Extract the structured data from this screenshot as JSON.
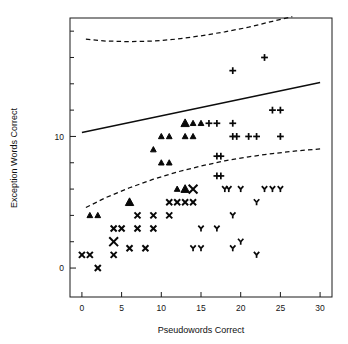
{
  "chart_data": {
    "type": "scatter",
    "title": "",
    "xlabel": "Pseudowords Correct",
    "ylabel": "Exception Words Correct",
    "xlim": [
      -1.5,
      31.5
    ],
    "ylim": [
      -2.2,
      19.0
    ],
    "xticks": [
      0,
      5,
      10,
      15,
      20,
      25,
      30
    ],
    "xtick_labels": [
      "0",
      "5",
      "10",
      "15",
      "20",
      "25",
      "30"
    ],
    "yticks": [
      0,
      2,
      4,
      6,
      8,
      10,
      12,
      14,
      16,
      18
    ],
    "ytick_labels": [
      "0",
      "",
      "",
      "",
      "",
      "10",
      "",
      "",
      "",
      ""
    ],
    "ytick_labeled": [
      0,
      10
    ],
    "grid": false,
    "legend": "none",
    "frame": "box",
    "series": [
      {
        "name": "group-triangle",
        "marker": "triangle-up",
        "points": [
          {
            "x": 1,
            "y": 4,
            "size": "small"
          },
          {
            "x": 2,
            "y": 4,
            "size": "small"
          },
          {
            "x": 6,
            "y": 5,
            "size": "large"
          },
          {
            "x": 9,
            "y": 9,
            "size": "small"
          },
          {
            "x": 10,
            "y": 8,
            "size": "small"
          },
          {
            "x": 10,
            "y": 10,
            "size": "small"
          },
          {
            "x": 11,
            "y": 8,
            "size": "small"
          },
          {
            "x": 11,
            "y": 10,
            "size": "small"
          },
          {
            "x": 12,
            "y": 6,
            "size": "small"
          },
          {
            "x": 13,
            "y": 6,
            "size": "large"
          },
          {
            "x": 13,
            "y": 10,
            "size": "small"
          },
          {
            "x": 13,
            "y": 11,
            "size": "large"
          },
          {
            "x": 14,
            "y": 10,
            "size": "small"
          },
          {
            "x": 14,
            "y": 11,
            "size": "small"
          },
          {
            "x": 15,
            "y": 11,
            "size": "small"
          }
        ]
      },
      {
        "name": "group-cross",
        "marker": "x-cross",
        "points": [
          {
            "x": 0,
            "y": 1,
            "size": "small"
          },
          {
            "x": 1,
            "y": 1,
            "size": "small"
          },
          {
            "x": 2,
            "y": 0,
            "size": "small"
          },
          {
            "x": 4,
            "y": 1,
            "size": "small"
          },
          {
            "x": 4,
            "y": 2,
            "size": "large"
          },
          {
            "x": 4,
            "y": 3,
            "size": "small"
          },
          {
            "x": 5,
            "y": 3,
            "size": "small"
          },
          {
            "x": 6,
            "y": 1.5,
            "size": "small"
          },
          {
            "x": 7,
            "y": 3,
            "size": "small"
          },
          {
            "x": 7,
            "y": 4,
            "size": "small"
          },
          {
            "x": 8,
            "y": 1.5,
            "size": "small"
          },
          {
            "x": 9,
            "y": 3,
            "size": "small"
          },
          {
            "x": 9,
            "y": 4,
            "size": "small"
          },
          {
            "x": 11,
            "y": 4,
            "size": "small"
          },
          {
            "x": 11,
            "y": 5,
            "size": "small"
          },
          {
            "x": 12,
            "y": 5,
            "size": "small"
          },
          {
            "x": 13,
            "y": 5,
            "size": "small"
          },
          {
            "x": 14,
            "y": 6,
            "size": "large"
          },
          {
            "x": 14,
            "y": 5,
            "size": "small"
          }
        ]
      },
      {
        "name": "group-plus",
        "marker": "plus",
        "points": [
          {
            "x": 16,
            "y": 11,
            "size": "small"
          },
          {
            "x": 17,
            "y": 8.5,
            "size": "small"
          },
          {
            "x": 17,
            "y": 7,
            "size": "small"
          },
          {
            "x": 17,
            "y": 11,
            "size": "small"
          },
          {
            "x": 17.5,
            "y": 8.5,
            "size": "small"
          },
          {
            "x": 17.5,
            "y": 7,
            "size": "small"
          },
          {
            "x": 19,
            "y": 10,
            "size": "small"
          },
          {
            "x": 19,
            "y": 15,
            "size": "small"
          },
          {
            "x": 19.5,
            "y": 10,
            "size": "small"
          },
          {
            "x": 19,
            "y": 11,
            "size": "small"
          },
          {
            "x": 21,
            "y": 10,
            "size": "small"
          },
          {
            "x": 22,
            "y": 10,
            "size": "small"
          },
          {
            "x": 23,
            "y": 16,
            "size": "small"
          },
          {
            "x": 24,
            "y": 12,
            "size": "small"
          },
          {
            "x": 25,
            "y": 12,
            "size": "small"
          },
          {
            "x": 25,
            "y": 10,
            "size": "small"
          }
        ]
      },
      {
        "name": "group-y",
        "marker": "y-shape",
        "points": [
          {
            "x": 14,
            "y": 1.5,
            "size": "small"
          },
          {
            "x": 15,
            "y": 1.5,
            "size": "small"
          },
          {
            "x": 15,
            "y": 3,
            "size": "small"
          },
          {
            "x": 17,
            "y": 3,
            "size": "small"
          },
          {
            "x": 18,
            "y": 6,
            "size": "small"
          },
          {
            "x": 19,
            "y": 4,
            "size": "small"
          },
          {
            "x": 19,
            "y": 1.5,
            "size": "small"
          },
          {
            "x": 20,
            "y": 2,
            "size": "small"
          },
          {
            "x": 20,
            "y": 6,
            "size": "small"
          },
          {
            "x": 22,
            "y": 5,
            "size": "small"
          },
          {
            "x": 22,
            "y": 1,
            "size": "small"
          },
          {
            "x": 23,
            "y": 6,
            "size": "small"
          },
          {
            "x": 24,
            "y": 6,
            "size": "small"
          },
          {
            "x": 25,
            "y": 6,
            "size": "small"
          },
          {
            "x": 18.5,
            "y": 6,
            "size": "small"
          }
        ]
      }
    ],
    "lines": [
      {
        "name": "regression-line",
        "style": "solid",
        "points": [
          [
            0,
            10.3
          ],
          [
            30,
            14.1
          ]
        ]
      },
      {
        "name": "upper-band",
        "style": "dashed",
        "points": [
          [
            0.5,
            17.4
          ],
          [
            3,
            17.25
          ],
          [
            6,
            17.2
          ],
          [
            9,
            17.25
          ],
          [
            12,
            17.4
          ],
          [
            15,
            17.65
          ],
          [
            18,
            17.95
          ],
          [
            21,
            18.3
          ],
          [
            24,
            18.75
          ],
          [
            26.5,
            19.1
          ]
        ]
      },
      {
        "name": "lower-band",
        "style": "dashed",
        "points": [
          [
            0.5,
            4.6
          ],
          [
            3,
            5.35
          ],
          [
            6,
            6.1
          ],
          [
            9,
            6.75
          ],
          [
            12,
            7.3
          ],
          [
            15,
            7.75
          ],
          [
            18,
            8.15
          ],
          [
            21,
            8.45
          ],
          [
            24,
            8.7
          ],
          [
            27,
            8.9
          ],
          [
            30,
            9.05
          ]
        ]
      }
    ]
  },
  "axis": {
    "x_label": "Pseudowords Correct",
    "y_label": "Exception Words Correct",
    "x_tick_labels": [
      "0",
      "5",
      "10",
      "15",
      "20",
      "25",
      "30"
    ],
    "y_tick_labels": [
      "10",
      "0"
    ]
  }
}
